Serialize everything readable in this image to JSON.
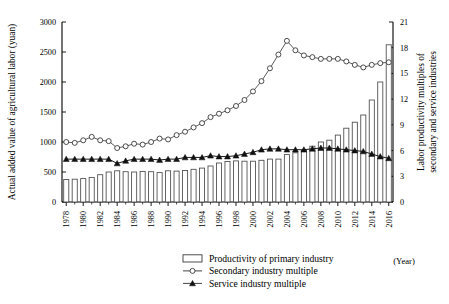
{
  "chart_data": {
    "type": "bar",
    "title": "",
    "subtitle": "",
    "xlabel": "(Year)",
    "ylabel": "Actual added value of agricultural labor (yuan)",
    "y2label": "Labor productivity multiples of secondary and service industries",
    "grid": false,
    "legend_position": "bottom-center",
    "ylim": [
      0,
      3000
    ],
    "y2lim": [
      0,
      21
    ],
    "yticks": [
      0,
      500,
      1000,
      1500,
      2000,
      2500,
      3000
    ],
    "y2ticks": [
      0,
      3,
      6,
      9,
      12,
      15,
      18,
      21
    ],
    "x": [
      1978,
      1979,
      1980,
      1981,
      1982,
      1983,
      1984,
      1985,
      1986,
      1987,
      1988,
      1989,
      1990,
      1991,
      1992,
      1993,
      1994,
      1995,
      1996,
      1997,
      1998,
      1999,
      2000,
      2001,
      2002,
      2003,
      2004,
      2005,
      2006,
      2007,
      2008,
      2009,
      2010,
      2011,
      2012,
      2013,
      2014,
      2015,
      2016
    ],
    "xtick_labels": [
      "1978",
      "1980",
      "1982",
      "1984",
      "1986",
      "1988",
      "1990",
      "1992",
      "1994",
      "1996",
      "1998",
      "2000",
      "2002",
      "2004",
      "2006",
      "2008",
      "2010",
      "2012",
      "2014",
      "2016"
    ],
    "series": [
      {
        "name": "Productivity of primary industry",
        "axis": "left",
        "kind": "bar",
        "unit": "yuan",
        "values": [
          375,
          380,
          390,
          410,
          455,
          500,
          520,
          505,
          500,
          510,
          505,
          490,
          520,
          515,
          525,
          545,
          565,
          600,
          650,
          675,
          685,
          680,
          680,
          695,
          715,
          715,
          790,
          820,
          860,
          930,
          1000,
          1030,
          1115,
          1230,
          1330,
          1450,
          1700,
          2000,
          2620
        ]
      },
      {
        "name": "Secondary industry multiple",
        "axis": "right",
        "kind": "line-open-circle",
        "unit": "multiple",
        "values": [
          7.0,
          6.9,
          7.2,
          7.6,
          7.2,
          7.1,
          6.3,
          6.5,
          6.8,
          6.7,
          7.0,
          7.4,
          7.3,
          7.8,
          8.2,
          8.7,
          9.2,
          9.9,
          10.3,
          10.7,
          11.2,
          11.9,
          12.9,
          14.1,
          15.6,
          17.2,
          18.8,
          17.7,
          17.1,
          16.9,
          16.7,
          16.7,
          16.7,
          16.4,
          16.0,
          15.7,
          16.0,
          16.2,
          16.3
        ]
      },
      {
        "name": "Service industry multiple",
        "axis": "right",
        "kind": "line-filled-triangle",
        "unit": "multiple",
        "values": [
          5.0,
          5.0,
          5.0,
          5.0,
          5.0,
          5.0,
          4.5,
          4.8,
          5.0,
          5.0,
          5.0,
          4.9,
          5.0,
          5.0,
          5.2,
          5.2,
          5.2,
          5.4,
          5.3,
          5.3,
          5.4,
          5.6,
          5.8,
          6.1,
          6.2,
          6.2,
          6.1,
          6.1,
          6.1,
          6.2,
          6.3,
          6.3,
          6.2,
          6.1,
          6.0,
          5.9,
          5.6,
          5.3,
          5.1
        ]
      }
    ]
  },
  "legend": {
    "items": [
      {
        "label": "Productivity of primary industry",
        "marker": "bar-swatch"
      },
      {
        "label": "Secondary industry multiple",
        "marker": "open-circle-line"
      },
      {
        "label": "Service industry multiple",
        "marker": "filled-triangle-line"
      }
    ]
  }
}
